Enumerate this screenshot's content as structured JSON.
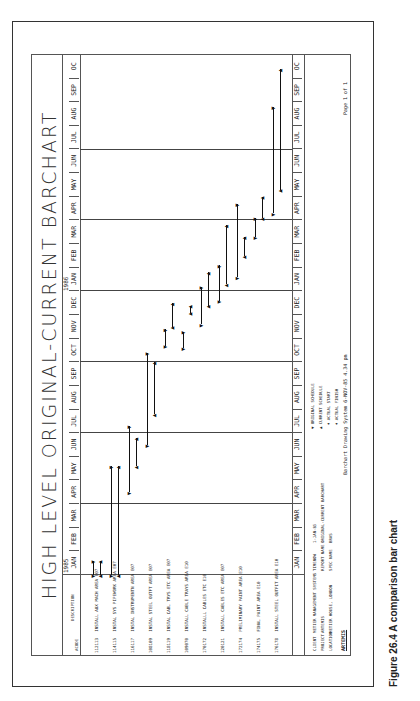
{
  "chart_data": {
    "type": "gantt",
    "title": "HIGH LEVEL ORIGINAL-CURRENT BARCHART",
    "x_axis": {
      "years": [
        "1985",
        "1986"
      ],
      "months": [
        "JAN",
        "FEB",
        "MAR",
        "APR",
        "MAY",
        "JUN",
        "JUL",
        "AUG",
        "SEP",
        "OCT",
        "NOV",
        "DEC",
        "JAN",
        "FEB",
        "MAR",
        "APR",
        "MAY",
        "JUN",
        "JUL",
        "AUG",
        "SEP",
        "OC"
      ]
    },
    "columns": [
      "ACODE",
      "DESCRIPTION"
    ],
    "tasks": [
      {
        "acode": "112113",
        "description": "INSTALL AUX MACH AREA E07",
        "original": [
          0.0,
          0.6
        ],
        "current": [
          0.0,
          0.6
        ]
      },
      {
        "acode": "114115",
        "description": "INSTAL SYS PIPEWORK AREA E07",
        "original": [
          0.0,
          4.6
        ],
        "current": [
          0.0,
          4.6
        ]
      },
      {
        "acode": "116117",
        "description": "INSTAL INSTRUMENTN AREA E07",
        "original": [
          3.5,
          6.3
        ],
        "current": [
          4.6,
          5.8
        ]
      },
      {
        "acode": "108109",
        "description": "INSTAL STEEL OUTFT AREA E07",
        "original": [
          5.5,
          9.4
        ],
        "current": [
          6.8,
          9.0
        ]
      },
      {
        "acode": "118119",
        "description": "INSTAL CABL TRYS ETC AREA E07",
        "original": [
          9.7,
          10.4
        ],
        "current": [
          10.5,
          11.5
        ]
      },
      {
        "acode": "109070",
        "description": "INSTALL CABLE TRAYS AREA E10",
        "original": [
          9.6,
          10.3
        ],
        "current": [
          11.1,
          11.4
        ]
      },
      {
        "acode": "170172",
        "description": "INSTALLL CABLES ETC E10",
        "original": [
          10.6,
          12.2
        ],
        "current": [
          11.4,
          12.8
        ]
      },
      {
        "acode": "120121",
        "description": "INSTALL CABLES ETC AREA E07",
        "original": [
          11.6,
          13.1
        ],
        "current": [
          12.3,
          14.8
        ]
      },
      {
        "acode": "172174",
        "description": "PRELIMINARY PAINT AREA E10",
        "original": [
          12.6,
          15.7
        ],
        "current": [
          13.5,
          14.3
        ]
      },
      {
        "acode": "174175",
        "description": "FINAL PAINT AREA E10",
        "original": [
          14.3,
          15.1
        ],
        "current": [
          15.1,
          16.0
        ]
      },
      {
        "acode": "176178",
        "description": "INSTALL STEEL OUTFIT AREA E10",
        "original": [
          15.3,
          19.8
        ],
        "current": [
          16.3,
          21.4
        ]
      }
    ],
    "legend": [
      "ORIGINAL SCHEDULE",
      "CURRENT SCHEDULE",
      "ACTUAL START",
      "ACTUAL FINISH"
    ]
  },
  "info": {
    "client_label": "CLIENT",
    "client": "METIER MANAGEMENT SYSTEMS",
    "project_label": "PROJECT",
    "project": "ARTEMIS",
    "location_label": "LOCATION",
    "location": "METIER HOUSE, LONDON",
    "timenow_label": "TIMENOW",
    "timenow": "1-JAN-85",
    "report_label": "REPORT NAME -",
    "report": "ORIGINAL-CURRENT BARCHART",
    "spec_label": "SPEC NAME",
    "spec": "BRAS",
    "system": "Barchart Drawing System  6-NOV-85  4.34 pm",
    "page": "Page  1  of  1",
    "logo": "ARTEMIS"
  },
  "caption": "Figure 26.4 A comparison bar chart"
}
